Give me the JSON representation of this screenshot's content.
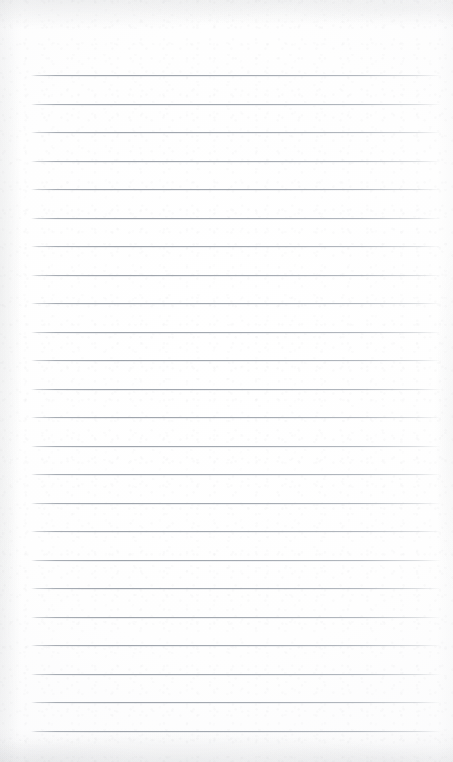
{
  "document": {
    "kind": "ruled-notepad-page",
    "title": "Blank Ruled Notepad Page",
    "content_text": "",
    "page_width": 453,
    "page_height": 762
  },
  "paper": {
    "background_color": "#fdfdfd",
    "base_white": "#ffffff",
    "edge_tint_color": "#92969c",
    "grain_color": "#787c82",
    "texture": "fine fibre grain with soft mottling at top, left and bottom edges"
  },
  "rules": {
    "line_color": "#a0a6ae",
    "line_halo_color": "#c8ccd2",
    "line_thickness": 1,
    "line_left_x": 31,
    "line_right_x": 441,
    "line_width": 410,
    "first_line_y": 75,
    "line_spacing": 28.5,
    "line_count": 24,
    "top_margin": 75,
    "bottom_margin": 31,
    "left_margin": 31,
    "right_margin": 12,
    "y_positions": [
      75,
      103.5,
      132,
      160.5,
      189,
      217.5,
      246,
      274.5,
      303,
      331.5,
      360,
      388.5,
      417,
      445.5,
      474,
      502.5,
      531,
      559.5,
      588,
      616.5,
      645,
      673.5,
      702,
      730.5
    ]
  }
}
